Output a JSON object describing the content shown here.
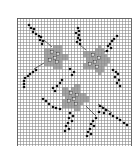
{
  "pattern": {
    "title": "Floral cross-stitch chart",
    "grid": {
      "origin_x": 17,
      "origin_y": 18,
      "cell": 3,
      "cols": 38,
      "rows": 43,
      "line_color": "#8a8a8a",
      "border_color": "#555555"
    },
    "colors": {
      "stitch": "#111111",
      "flower_fill": "#a8a8a8",
      "flower_center": "#ffffff",
      "stem": "#444444",
      "background": "#ffffff"
    },
    "flowers": [
      {
        "cx": 55,
        "cy": 57,
        "r": 14
      },
      {
        "cx": 96,
        "cy": 60,
        "r": 15
      },
      {
        "cx": 74,
        "cy": 98,
        "r": 15
      }
    ],
    "flower_centers": [
      [
        52,
        52
      ],
      [
        58,
        54
      ],
      [
        55,
        58
      ],
      [
        50,
        60
      ],
      [
        57,
        62
      ],
      [
        93,
        55
      ],
      [
        99,
        58
      ],
      [
        95,
        62
      ],
      [
        90,
        64
      ],
      [
        97,
        67
      ],
      [
        71,
        93
      ],
      [
        77,
        95
      ],
      [
        74,
        99
      ],
      [
        69,
        101
      ],
      [
        76,
        104
      ]
    ],
    "stitches": [
      [
        29,
        25
      ],
      [
        31,
        28
      ],
      [
        34,
        29
      ],
      [
        33,
        32
      ],
      [
        36,
        34
      ],
      [
        39,
        36
      ],
      [
        41,
        37
      ],
      [
        40,
        40
      ],
      [
        43,
        41
      ],
      [
        42,
        44
      ],
      [
        78,
        28
      ],
      [
        79,
        31
      ],
      [
        76,
        33
      ],
      [
        79,
        35
      ],
      [
        78,
        38
      ],
      [
        80,
        40
      ],
      [
        77,
        42
      ],
      [
        80,
        44
      ],
      [
        117,
        36
      ],
      [
        114,
        39
      ],
      [
        112,
        41
      ],
      [
        110,
        44
      ],
      [
        108,
        46
      ],
      [
        111,
        48
      ],
      [
        107,
        51
      ],
      [
        36,
        70
      ],
      [
        33,
        72
      ],
      [
        30,
        74
      ],
      [
        28,
        76
      ],
      [
        25,
        78
      ],
      [
        24,
        81
      ],
      [
        24,
        84
      ],
      [
        24,
        87
      ],
      [
        70,
        69
      ],
      [
        74,
        72
      ],
      [
        72,
        75
      ],
      [
        62,
        80
      ],
      [
        60,
        83
      ],
      [
        57,
        86
      ],
      [
        53,
        88
      ],
      [
        55,
        91
      ],
      [
        113,
        70
      ],
      [
        116,
        72
      ],
      [
        118,
        74
      ],
      [
        115,
        77
      ],
      [
        119,
        80
      ],
      [
        117,
        83
      ],
      [
        120,
        86
      ],
      [
        43,
        99
      ],
      [
        46,
        101
      ],
      [
        49,
        104
      ],
      [
        53,
        107
      ],
      [
        56,
        108
      ],
      [
        60,
        109
      ],
      [
        100,
        106
      ],
      [
        103,
        108
      ],
      [
        106,
        110
      ],
      [
        99,
        112
      ],
      [
        104,
        113
      ],
      [
        110,
        114
      ],
      [
        113,
        116
      ],
      [
        117,
        118
      ],
      [
        120,
        120
      ],
      [
        124,
        123
      ],
      [
        127,
        125
      ],
      [
        70,
        113
      ],
      [
        73,
        116
      ],
      [
        69,
        118
      ],
      [
        72,
        121
      ],
      [
        68,
        123
      ],
      [
        66,
        126
      ],
      [
        69,
        129
      ],
      [
        65,
        131
      ],
      [
        96,
        118
      ],
      [
        93,
        121
      ],
      [
        91,
        124
      ],
      [
        94,
        126
      ],
      [
        90,
        129
      ],
      [
        88,
        132
      ],
      [
        91,
        134
      ],
      [
        87,
        136
      ]
    ],
    "stems": [
      [
        [
          44,
          40
        ],
        [
          52,
          47
        ]
      ],
      [
        [
          34,
          69
        ],
        [
          44,
          63
        ]
      ],
      [
        [
          80,
          45
        ],
        [
          86,
          50
        ]
      ],
      [
        [
          108,
          50
        ],
        [
          104,
          52
        ]
      ],
      [
        [
          98,
          104
        ],
        [
          112,
          113
        ]
      ],
      [
        [
          96,
          116
        ],
        [
          86,
          106
        ]
      ]
    ]
  }
}
